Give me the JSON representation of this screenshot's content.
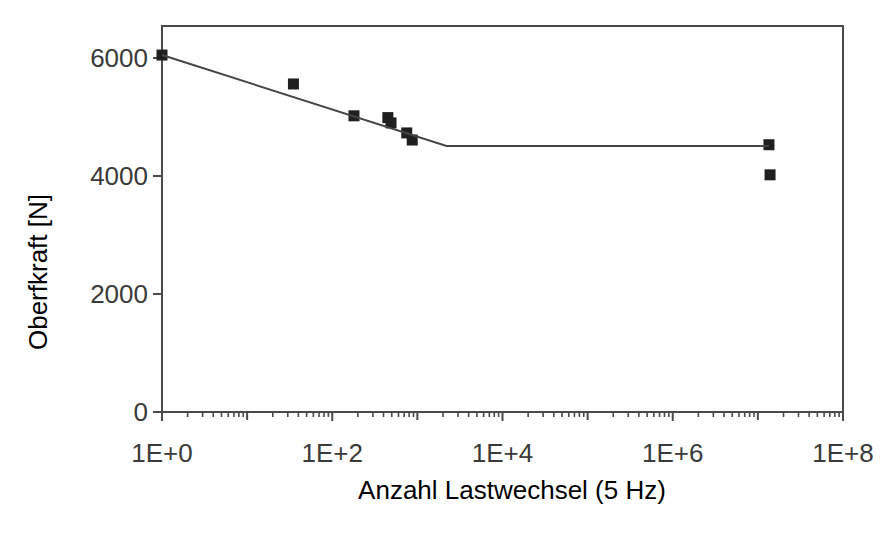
{
  "figure": {
    "background": "#ffffff",
    "axis_color": "#4a4a4a",
    "text_color": "#3a3a3a",
    "marker_color": "#1f1f1f",
    "line_color": "#454545"
  },
  "chart_data": {
    "type": "scatter",
    "title": "",
    "xlabel": "Anzahl Lastwechsel (5 Hz)",
    "ylabel": "Oberfkraft [N]",
    "x_scale": "log",
    "x_range": [
      1,
      100000000
    ],
    "y_range": [
      0,
      6550
    ],
    "grid": false,
    "legend": false,
    "x_major_ticks": [
      {
        "value": 1,
        "label": "1E+0"
      },
      {
        "value": 100,
        "label": "1E+2"
      },
      {
        "value": 10000,
        "label": "1E+4"
      },
      {
        "value": 1000000,
        "label": "1E+6"
      },
      {
        "value": 100000000,
        "label": "1E+8"
      }
    ],
    "x_unlabeled_decades": [
      10,
      1000,
      100000,
      10000000
    ],
    "x_minor_steps": [
      2,
      3,
      4,
      5,
      6,
      7,
      8,
      9
    ],
    "y_ticks": [
      {
        "value": 0,
        "label": "0"
      },
      {
        "value": 2000,
        "label": "2000"
      },
      {
        "value": 4000,
        "label": "4000"
      },
      {
        "value": 6000,
        "label": "6000"
      }
    ],
    "series": [
      {
        "name": "Messpunkte",
        "type": "scatter",
        "marker": "square",
        "marker_size_px": 11,
        "color": "#1f1f1f",
        "points": [
          {
            "x": 1,
            "y": 6050
          },
          {
            "x": 35,
            "y": 5560
          },
          {
            "x": 180,
            "y": 5020
          },
          {
            "x": 450,
            "y": 4990
          },
          {
            "x": 490,
            "y": 4900
          },
          {
            "x": 750,
            "y": 4730
          },
          {
            "x": 870,
            "y": 4610
          },
          {
            "x": 13500000,
            "y": 4530
          },
          {
            "x": 13900000,
            "y": 4020
          }
        ]
      },
      {
        "name": "Trendlinie",
        "type": "line",
        "color": "#454545",
        "points": [
          {
            "x": 1,
            "y": 6050
          },
          {
            "x": 2200,
            "y": 4510
          },
          {
            "x": 13500000,
            "y": 4510
          }
        ]
      }
    ]
  }
}
